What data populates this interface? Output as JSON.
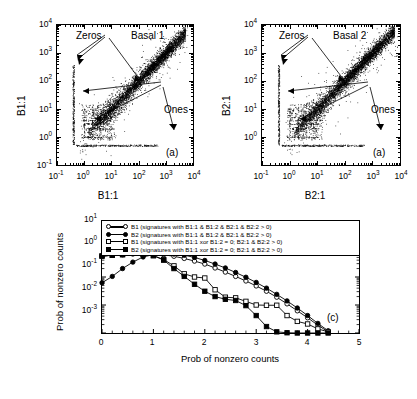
{
  "figure": {
    "panels": [
      {
        "id": "a1",
        "tag": "(a)",
        "title": "Basal 1",
        "xlabel": "B1:1",
        "ylabel": "B1:1",
        "annotations": [
          {
            "name": "zeros",
            "text": "Zeros"
          },
          {
            "name": "ones",
            "text": "Ones"
          }
        ],
        "xticks": [
          "10-1",
          "100",
          "101",
          "102",
          "103",
          "104"
        ],
        "yticks": [
          "10-1",
          "100",
          "101",
          "102",
          "103",
          "104"
        ]
      },
      {
        "id": "a2",
        "tag": "(a)",
        "title": "Basal 2",
        "xlabel": "B2:1",
        "ylabel": "B2:1",
        "annotations": [
          {
            "name": "zeros",
            "text": "Zeros"
          },
          {
            "name": "ones",
            "text": "Ones"
          }
        ],
        "xticks": [
          "10-1",
          "100",
          "101",
          "102",
          "103",
          "104"
        ],
        "yticks": [
          "10-1",
          "100",
          "101",
          "102",
          "103",
          "104"
        ]
      }
    ],
    "panel_c": {
      "tag": "(c)",
      "xlabel": "Prob of nonzero counts",
      "ylabel": "Prob of nonzero counts",
      "xticks": [
        "0",
        "1",
        "2",
        "3",
        "4",
        "5"
      ],
      "yticks": [
        "101",
        "100",
        "10-1",
        "10-2",
        "10-3"
      ],
      "legend": [
        "B1 (signatures with B1:1 & B1:2 & B2:1 & B2:2 > 0)",
        "B2 (signatures with B1:1 & B1:2 & B2:1 & B2:2 > 0)",
        "B1 (signatures with B1:1 xor B1:2 = 0; B2:1 & B2:2 > 0)",
        "B2 (signatures with B1:1 xor B1:2 = 0; B2:1 & B2:2 > 0)"
      ]
    }
  },
  "chart_data": [
    {
      "type": "scatter",
      "title": "Basal 1",
      "panel_label": "(a)",
      "xlabel": "B1:1",
      "ylabel": "B1:1",
      "xscale": "log",
      "yscale": "log",
      "xlim": [
        0.1,
        10000
      ],
      "ylim": [
        0.1,
        10000
      ],
      "xtick_values": [
        0.1,
        1,
        10,
        100,
        1000,
        10000
      ],
      "ytick_values": [
        0.1,
        1,
        10,
        100,
        1000,
        10000
      ],
      "grid": false,
      "description": "Dense diagonal cloud of replicate counts along y=x from about 1 to 5000, with a vertical stripe of zero-valued points at x about 0.4 and a horizontal stripe of zero-valued points at y about 0.5; discrete low-count lattice lines for counts of one and other small integers.",
      "annotations": [
        {
          "text": "Zeros",
          "points_to": "vertical and horizontal stripes of zero counts"
        },
        {
          "text": "Ones",
          "points_to": "discrete lattice lines at low integer counts"
        }
      ]
    },
    {
      "type": "scatter",
      "title": "Basal 2",
      "panel_label": "(a)",
      "xlabel": "B2:1",
      "ylabel": "B2:1",
      "xscale": "log",
      "yscale": "log",
      "xlim": [
        0.1,
        10000
      ],
      "ylim": [
        0.1,
        10000
      ],
      "xtick_values": [
        0.1,
        1,
        10,
        100,
        1000,
        10000
      ],
      "ytick_values": [
        0.1,
        1,
        10,
        100,
        1000,
        10000
      ],
      "grid": false,
      "description": "Dense diagonal cloud of replicate counts along y=x from about 1 to 6000, with a vertical stripe of zero-valued points at x about 0.4 and a horizontal stripe of zero-valued points at y about 0.5; discrete low-count lattice lines for counts of one and other small integers.",
      "annotations": [
        {
          "text": "Zeros",
          "points_to": "vertical and horizontal stripes of zero counts"
        },
        {
          "text": "Ones",
          "points_to": "discrete lattice lines at low integer counts"
        }
      ]
    },
    {
      "type": "line",
      "panel_label": "(c)",
      "title": "",
      "xlabel": "Prob of nonzero counts",
      "ylabel": "Prob of nonzero counts",
      "xscale": "linear",
      "yscale": "log",
      "xlim": [
        0,
        5
      ],
      "ylim": [
        0.001,
        10
      ],
      "xtick_values": [
        0,
        1,
        2,
        3,
        4,
        5
      ],
      "ytick_values": [
        0.001,
        0.01,
        0.1,
        1,
        10
      ],
      "grid": false,
      "legend_position": "top-inside",
      "x": [
        0,
        0.2,
        0.4,
        0.6,
        0.8,
        1.0,
        1.2,
        1.4,
        1.6,
        1.8,
        2.0,
        2.2,
        2.4,
        2.6,
        2.8,
        3.0,
        3.2,
        3.4,
        3.6,
        3.8,
        4.0,
        4.2,
        4.4
      ],
      "series": [
        {
          "name": "B1 (signatures with B1:1 & B1:2 & B2:1 & B2:2 > 0)",
          "marker": "open-circle",
          "values": [
            0.55,
            0.6,
            0.62,
            0.66,
            0.68,
            0.67,
            0.62,
            0.55,
            0.46,
            0.37,
            0.29,
            0.21,
            0.15,
            0.105,
            0.072,
            0.048,
            0.031,
            0.019,
            0.011,
            0.0062,
            0.0035,
            0.0019,
            0.0011
          ]
        },
        {
          "name": "B2 (signatures with B1:1 & B1:2 & B2:1 & B2:2 > 0)",
          "marker": "filled-circle",
          "values": [
            0.062,
            0.105,
            0.2,
            0.34,
            0.52,
            0.63,
            0.67,
            0.66,
            0.6,
            0.5,
            0.39,
            0.29,
            0.21,
            0.145,
            0.098,
            0.064,
            0.04,
            0.024,
            0.014,
            0.0078,
            0.0042,
            0.0022,
            0.0012
          ]
        },
        {
          "name": "B1 (signatures with B1:1 xor B1:2 = 0; B2:1 & B2:2 > 0)",
          "marker": "open-square",
          "values": [
            0.56,
            0.6,
            0.63,
            0.7,
            0.66,
            0.58,
            0.42,
            0.25,
            0.13,
            0.1,
            0.092,
            0.035,
            0.019,
            0.018,
            0.0135,
            0.01,
            0.0098,
            0.0098,
            0.0042,
            0.0026,
            0.0021,
            0.0014,
            0.0011
          ]
        },
        {
          "name": "B2 (signatures with B1:1 xor B1:2 = 0; B2:1 & B2:2 > 0)",
          "marker": "filled-square",
          "values": [
            0.56,
            0.6,
            0.63,
            0.95,
            0.66,
            0.58,
            0.4,
            0.2,
            0.105,
            0.055,
            0.031,
            0.02,
            0.016,
            0.0145,
            0.0095,
            0.0042,
            0.0017,
            0.0011,
            0.00102,
            0.001,
            0.001,
            0.001,
            0.001
          ]
        }
      ]
    }
  ]
}
